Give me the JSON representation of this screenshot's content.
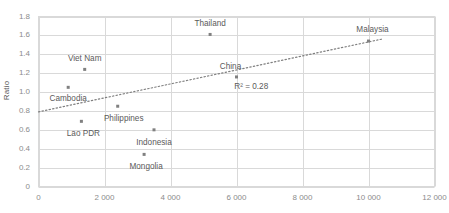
{
  "chart_data": {
    "type": "scatter",
    "title": "",
    "xlabel": "",
    "ylabel": "Ratio",
    "xlim": [
      0,
      12000
    ],
    "ylim": [
      0,
      1.8
    ],
    "grid": true,
    "legend_position": "none",
    "x_tick_labels": [
      "0",
      "2 000",
      "4 000",
      "6 000",
      "8 000",
      "10 000",
      "12 000"
    ],
    "x_ticks": [
      0,
      2000,
      4000,
      6000,
      8000,
      10000,
      12000
    ],
    "y_tick_labels": [
      "0",
      "0.2",
      "0.4",
      "0.6",
      "0.8",
      "1.0",
      "1.2",
      "1.4",
      "1.6",
      "1.8"
    ],
    "y_ticks": [
      0,
      0.2,
      0.4,
      0.6,
      0.8,
      1.0,
      1.2,
      1.4,
      1.6,
      1.8
    ],
    "points": [
      {
        "label": "Cambodia",
        "x": 900,
        "y": 1.05,
        "label_dx": 0,
        "label_dy": 12
      },
      {
        "label": "Lao PDR",
        "x": 1300,
        "y": 0.69,
        "label_dx": 2,
        "label_dy": 13
      },
      {
        "label": "Viet Nam",
        "x": 1400,
        "y": 1.24,
        "label_dx": 0,
        "label_dy": -10
      },
      {
        "label": "Philippines",
        "x": 2400,
        "y": 0.85,
        "label_dx": 6,
        "label_dy": 13
      },
      {
        "label": "Mongolia",
        "x": 3200,
        "y": 0.34,
        "label_dx": 2,
        "label_dy": 13
      },
      {
        "label": "Indonesia",
        "x": 3500,
        "y": 0.6,
        "label_dx": 0,
        "label_dy": 13
      },
      {
        "label": "Thailand",
        "x": 5200,
        "y": 1.61,
        "label_dx": 0,
        "label_dy": -10
      },
      {
        "label": "China",
        "x": 6000,
        "y": 1.16,
        "label_dx": -6,
        "label_dy": -10
      },
      {
        "label": "Malaysia",
        "x": 10000,
        "y": 1.54,
        "label_dx": 4,
        "label_dy": -11
      }
    ],
    "trendline": {
      "style": "dotted",
      "x_start": 0,
      "y_start": 0.79,
      "x_end": 10400,
      "y_end": 1.56
    },
    "annotations": [
      {
        "text": "R² = 0.28",
        "x": 6600,
        "y": 1.05
      }
    ],
    "colors": {
      "marker": "#808080",
      "trendline": "#808080",
      "gridline": "#d9d9d9",
      "axis_text": "#8c8c8c",
      "label_text": "#5a5a5a",
      "plot_border": "#d9d9d9",
      "background": "#ffffff"
    }
  }
}
